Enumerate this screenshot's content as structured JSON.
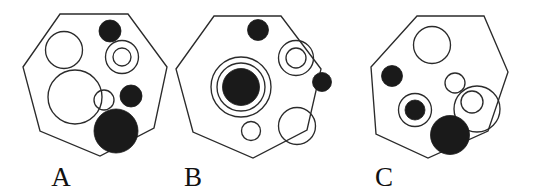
{
  "canvas": {
    "width": 538,
    "height": 195,
    "background": "#ffffff",
    "stroke_color": "#2b2b2b",
    "fill_color": "#1a1a1a",
    "label_color": "#111111"
  },
  "figures": [
    {
      "id": "figure-a",
      "label": "A",
      "label_x": 61,
      "label_y": 186,
      "polygon_points": "60,14 128,14 167,67 154,128 100,156 40,131 23,67",
      "shapes": [
        {
          "name": "circle-open-upper-left",
          "type": "open",
          "cx": 64,
          "cy": 50,
          "r": 18.5
        },
        {
          "name": "circle-filled-top",
          "type": "filled",
          "cx": 110,
          "cy": 31,
          "r": 11
        },
        {
          "name": "circle-ring-outer-right",
          "type": "open",
          "cx": 122,
          "cy": 57,
          "r": 16.5
        },
        {
          "name": "circle-ring-inner-right",
          "type": "open",
          "cx": 122,
          "cy": 57,
          "r": 9
        },
        {
          "name": "circle-open-large-left",
          "type": "open",
          "cx": 75,
          "cy": 97,
          "r": 27
        },
        {
          "name": "circle-open-small-center",
          "type": "open",
          "cx": 104,
          "cy": 100,
          "r": 10
        },
        {
          "name": "circle-filled-right",
          "type": "filled",
          "cx": 131,
          "cy": 96,
          "r": 11
        },
        {
          "name": "circle-filled-bottom",
          "type": "filled",
          "cx": 116,
          "cy": 131,
          "r": 22
        }
      ]
    },
    {
      "id": "figure-b",
      "label": "B",
      "label_x": 193,
      "label_y": 186,
      "polygon_points": "214,16 281,16 321,69 307,130 253,158 193,132 176,69",
      "shapes": [
        {
          "name": "circle-filled-top",
          "type": "filled",
          "cx": 258,
          "cy": 30,
          "r": 10.5
        },
        {
          "name": "circle-ring-outer-left",
          "type": "open",
          "cx": 241,
          "cy": 87,
          "r": 30
        },
        {
          "name": "circle-ring-middle-left",
          "type": "open",
          "cx": 241,
          "cy": 87,
          "r": 24
        },
        {
          "name": "circle-filled-center-left",
          "type": "filled",
          "cx": 241,
          "cy": 87,
          "r": 18.5
        },
        {
          "name": "circle-ring-outer-upper-right",
          "type": "open",
          "cx": 296,
          "cy": 58,
          "r": 17.5
        },
        {
          "name": "circle-ring-inner-upper-right",
          "type": "open",
          "cx": 296,
          "cy": 58,
          "r": 10
        },
        {
          "name": "circle-filled-right",
          "type": "filled",
          "cx": 322,
          "cy": 82,
          "r": 9.5
        },
        {
          "name": "circle-open-bottom-small",
          "type": "open",
          "cx": 251,
          "cy": 131,
          "r": 9.5
        },
        {
          "name": "circle-open-bottom-large",
          "type": "open",
          "cx": 297,
          "cy": 126,
          "r": 18.5
        }
      ]
    },
    {
      "id": "figure-c",
      "label": "C",
      "label_x": 384,
      "label_y": 186,
      "polygon_points": "417,16 484,16 508,72 488,131 428,158 376,134 371,67"
    }
  ],
  "figure_c_shapes": [
    {
      "name": "circle-open-top",
      "type": "open",
      "cx": 432,
      "cy": 45,
      "r": 18.5
    },
    {
      "name": "circle-filled-left",
      "type": "filled",
      "cx": 392,
      "cy": 76,
      "r": 10.5
    },
    {
      "name": "circle-open-small-center",
      "type": "open",
      "cx": 455,
      "cy": 83,
      "r": 10
    },
    {
      "name": "circle-ring-lower-left",
      "type": "open",
      "cx": 415,
      "cy": 110,
      "r": 16.5
    },
    {
      "name": "circle-filled-in-ring",
      "type": "filled",
      "cx": 415,
      "cy": 110,
      "r": 10
    },
    {
      "name": "circle-ring-outer-right",
      "type": "open",
      "cx": 477,
      "cy": 109,
      "r": 23
    },
    {
      "name": "circle-ring-inner-right",
      "type": "open",
      "cx": 472,
      "cy": 102,
      "r": 11
    },
    {
      "name": "circle-filled-bottom-large",
      "type": "filled",
      "cx": 450,
      "cy": 135,
      "r": 19.5
    }
  ]
}
